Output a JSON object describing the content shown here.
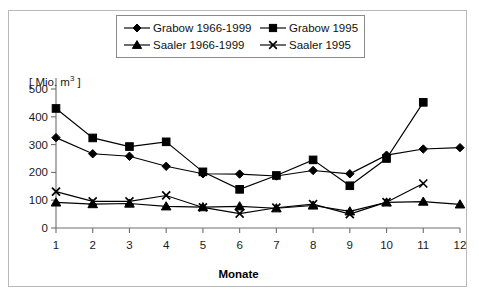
{
  "chart_data": {
    "type": "line",
    "title": "",
    "xlabel": "Monate",
    "ylabel": "[ Mio. m³ ]",
    "ylabel_prefix": "[ Mio. m",
    "ylabel_sup": "3",
    "ylabel_suffix": " ]",
    "categories": [
      "1",
      "2",
      "3",
      "4",
      "5",
      "6",
      "7",
      "8",
      "9",
      "10",
      "11",
      "12"
    ],
    "x": [
      1,
      2,
      3,
      4,
      5,
      6,
      7,
      8,
      9,
      10,
      11,
      12
    ],
    "ylim": [
      0,
      500
    ],
    "yticks": [
      0,
      100,
      200,
      300,
      400,
      500
    ],
    "ytick_labels": [
      "0",
      "100",
      "200",
      "300",
      "400",
      "500"
    ],
    "xtick_labels": [
      "1",
      "2",
      "3",
      "4",
      "5",
      "6",
      "7",
      "8",
      "9",
      "10",
      "11",
      "12"
    ],
    "grid": false,
    "legend_position": "top-center",
    "series": [
      {
        "name": "Grabow 1966-1999",
        "marker": "diamond",
        "color": "#000000",
        "x": [
          1,
          2,
          3,
          4,
          5,
          6,
          7,
          8,
          9,
          10,
          11,
          12
        ],
        "values": [
          325,
          267,
          258,
          222,
          195,
          194,
          187,
          207,
          195,
          262,
          284,
          289
        ]
      },
      {
        "name": "Grabow 1995",
        "marker": "square",
        "color": "#000000",
        "x": [
          1,
          2,
          3,
          4,
          5,
          6,
          7,
          8,
          9,
          10,
          11
        ],
        "values": [
          430,
          324,
          293,
          310,
          202,
          139,
          189,
          245,
          152,
          250,
          452
        ]
      },
      {
        "name": "Saaler 1966-1999",
        "marker": "triangle",
        "color": "#000000",
        "x": [
          1,
          2,
          3,
          4,
          5,
          6,
          7,
          8,
          9,
          10,
          11,
          12
        ],
        "values": [
          92,
          86,
          88,
          78,
          75,
          78,
          71,
          81,
          60,
          92,
          95,
          85
        ]
      },
      {
        "name": "Saaler 1995",
        "marker": "x",
        "color": "#000000",
        "x": [
          1,
          2,
          3,
          4,
          5,
          6,
          7,
          8,
          9,
          10,
          11
        ],
        "values": [
          131,
          96,
          96,
          117,
          74,
          52,
          73,
          86,
          50,
          93,
          160
        ]
      }
    ]
  },
  "legend": {
    "rows": [
      [
        {
          "label": "Grabow 1966-1999",
          "marker": "diamond"
        },
        {
          "label": "Grabow 1995",
          "marker": "square"
        }
      ],
      [
        {
          "label": "Saaler 1966-1999",
          "marker": "triangle"
        },
        {
          "label": "Saaler 1995",
          "marker": "x"
        }
      ]
    ]
  },
  "colors": {
    "series": "#000000",
    "axis": "#6e6e6e",
    "frame": "#b9b9b9",
    "legend_border": "#8a8a8a",
    "background": "#ffffff"
  }
}
